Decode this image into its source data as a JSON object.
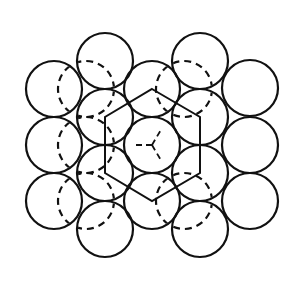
{
  "diagram": {
    "description": "Close-packed layer of spheres with a hexagonal unit outline and dashed outlines of the underlying layer",
    "stroke_color": "#111111",
    "background": "#ffffff",
    "sphere_radius": 28,
    "front_layer": [
      {
        "id": "c1r1",
        "cx": 54,
        "cy": 89
      },
      {
        "id": "c1r2",
        "cx": 54,
        "cy": 145
      },
      {
        "id": "c1r3",
        "cx": 54,
        "cy": 201
      },
      {
        "id": "c2r1",
        "cx": 105,
        "cy": 61
      },
      {
        "id": "c2r2",
        "cx": 105,
        "cy": 117
      },
      {
        "id": "c2r3",
        "cx": 105,
        "cy": 173
      },
      {
        "id": "c2r4",
        "cx": 105,
        "cy": 229
      },
      {
        "id": "c3r1",
        "cx": 152,
        "cy": 89
      },
      {
        "id": "c3r2",
        "cx": 152,
        "cy": 145
      },
      {
        "id": "c3r3",
        "cx": 152,
        "cy": 201
      },
      {
        "id": "c4r1",
        "cx": 200,
        "cy": 61
      },
      {
        "id": "c4r2",
        "cx": 200,
        "cy": 117
      },
      {
        "id": "c4r3",
        "cx": 200,
        "cy": 173
      },
      {
        "id": "c4r4",
        "cx": 200,
        "cy": 229
      },
      {
        "id": "c5r1",
        "cx": 250,
        "cy": 88
      },
      {
        "id": "c5r2",
        "cx": 250,
        "cy": 145
      },
      {
        "id": "c5r3",
        "cx": 250,
        "cy": 201
      }
    ],
    "hidden_layer": [
      {
        "id": "h1",
        "cx": 86,
        "cy": 89
      },
      {
        "id": "h2",
        "cx": 86,
        "cy": 145
      },
      {
        "id": "h3",
        "cx": 86,
        "cy": 201
      },
      {
        "id": "h4",
        "cx": 184,
        "cy": 89
      },
      {
        "id": "h5",
        "cx": 184,
        "cy": 201
      }
    ],
    "hexagon": {
      "points": [
        [
          152,
          89
        ],
        [
          200,
          117
        ],
        [
          200,
          173
        ],
        [
          152,
          201
        ],
        [
          105,
          173
        ],
        [
          105,
          117
        ]
      ]
    },
    "center_y_arms": [
      [
        [
          152,
          145
        ],
        [
          134,
          145
        ]
      ],
      [
        [
          152,
          145
        ],
        [
          162,
          128
        ]
      ],
      [
        [
          152,
          145
        ],
        [
          162,
          162
        ]
      ]
    ]
  }
}
